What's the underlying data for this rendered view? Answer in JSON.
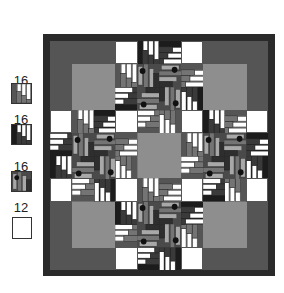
{
  "colors": {
    "border": "#2a2a2a",
    "dark": "#555555",
    "light_gray": "#8e8e8e",
    "medium": "#747474",
    "black": "#1c1c1c",
    "white": "#ffffff",
    "strip_light": "#a8a8a8"
  },
  "legend": [
    {
      "count": "16",
      "type": "steps-gray",
      "icon": "log-cabin-gray-block-icon"
    },
    {
      "count": "16",
      "type": "steps-black",
      "icon": "log-cabin-black-block-icon"
    },
    {
      "count": "16",
      "type": "dot",
      "icon": "dot-block-icon"
    },
    {
      "count": "12",
      "type": "white",
      "icon": "white-square-icon"
    }
  ],
  "quilt": {
    "units": 10,
    "corners": [
      {
        "r": 0,
        "c": 0,
        "light_r": 1,
        "light_c": 1
      },
      {
        "r": 0,
        "c": 7,
        "light_r": 1,
        "light_c": 7
      },
      {
        "r": 7,
        "c": 0,
        "light_r": 7,
        "light_c": 1
      },
      {
        "r": 7,
        "c": 7,
        "light_r": 7,
        "light_c": 7
      }
    ],
    "center": {
      "r": 4,
      "c": 4,
      "size": 2
    },
    "whites": [
      [
        0,
        3
      ],
      [
        0,
        6
      ],
      [
        3,
        0
      ],
      [
        3,
        3
      ],
      [
        3,
        6
      ],
      [
        3,
        9
      ],
      [
        6,
        0
      ],
      [
        6,
        3
      ],
      [
        6,
        6
      ],
      [
        6,
        9
      ],
      [
        9,
        3
      ],
      [
        9,
        6
      ]
    ],
    "pieced": [
      {
        "r": 0,
        "c": 4,
        "t": "B",
        "rot": 0
      },
      {
        "r": 0,
        "c": 5,
        "t": "B",
        "rot": 90
      },
      {
        "r": 1,
        "c": 3,
        "t": "A",
        "rot": 0
      },
      {
        "r": 2,
        "c": 3,
        "t": "B",
        "rot": 270
      },
      {
        "r": 1,
        "c": 6,
        "t": "A",
        "rot": 90
      },
      {
        "r": 2,
        "c": 6,
        "t": "B",
        "rot": 180
      },
      {
        "r": 1,
        "c": 4,
        "t": "C",
        "rot": 0
      },
      {
        "r": 1,
        "c": 5,
        "t": "C",
        "rot": 90
      },
      {
        "r": 2,
        "c": 4,
        "t": "C",
        "rot": 270
      },
      {
        "r": 2,
        "c": 5,
        "t": "C",
        "rot": 180
      },
      {
        "r": 3,
        "c": 4,
        "t": "A",
        "rot": 270
      },
      {
        "r": 3,
        "c": 5,
        "t": "A",
        "rot": 180
      },
      {
        "r": 9,
        "c": 4,
        "t": "B",
        "rot": 270
      },
      {
        "r": 9,
        "c": 5,
        "t": "B",
        "rot": 180
      },
      {
        "r": 8,
        "c": 3,
        "t": "A",
        "rot": 270
      },
      {
        "r": 7,
        "c": 3,
        "t": "B",
        "rot": 0
      },
      {
        "r": 8,
        "c": 6,
        "t": "A",
        "rot": 180
      },
      {
        "r": 7,
        "c": 6,
        "t": "B",
        "rot": 90
      },
      {
        "r": 7,
        "c": 4,
        "t": "C",
        "rot": 0
      },
      {
        "r": 7,
        "c": 5,
        "t": "C",
        "rot": 90
      },
      {
        "r": 8,
        "c": 4,
        "t": "C",
        "rot": 270
      },
      {
        "r": 8,
        "c": 5,
        "t": "C",
        "rot": 180
      },
      {
        "r": 6,
        "c": 4,
        "t": "A",
        "rot": 0
      },
      {
        "r": 6,
        "c": 5,
        "t": "A",
        "rot": 90
      },
      {
        "r": 4,
        "c": 0,
        "t": "B",
        "rot": 270
      },
      {
        "r": 5,
        "c": 0,
        "t": "B",
        "rot": 0
      },
      {
        "r": 3,
        "c": 1,
        "t": "A",
        "rot": 0
      },
      {
        "r": 3,
        "c": 2,
        "t": "B",
        "rot": 90
      },
      {
        "r": 6,
        "c": 1,
        "t": "A",
        "rot": 270
      },
      {
        "r": 6,
        "c": 2,
        "t": "B",
        "rot": 180
      },
      {
        "r": 4,
        "c": 1,
        "t": "C",
        "rot": 0
      },
      {
        "r": 4,
        "c": 2,
        "t": "C",
        "rot": 90
      },
      {
        "r": 5,
        "c": 1,
        "t": "C",
        "rot": 270
      },
      {
        "r": 5,
        "c": 2,
        "t": "C",
        "rot": 180
      },
      {
        "r": 4,
        "c": 3,
        "t": "A",
        "rot": 90
      },
      {
        "r": 5,
        "c": 3,
        "t": "A",
        "rot": 180
      },
      {
        "r": 4,
        "c": 9,
        "t": "B",
        "rot": 90
      },
      {
        "r": 5,
        "c": 9,
        "t": "B",
        "rot": 180
      },
      {
        "r": 3,
        "c": 8,
        "t": "A",
        "rot": 90
      },
      {
        "r": 3,
        "c": 7,
        "t": "B",
        "rot": 0
      },
      {
        "r": 6,
        "c": 8,
        "t": "A",
        "rot": 180
      },
      {
        "r": 6,
        "c": 7,
        "t": "B",
        "rot": 270
      },
      {
        "r": 4,
        "c": 7,
        "t": "C",
        "rot": 0
      },
      {
        "r": 4,
        "c": 8,
        "t": "C",
        "rot": 90
      },
      {
        "r": 5,
        "c": 7,
        "t": "C",
        "rot": 270
      },
      {
        "r": 5,
        "c": 8,
        "t": "C",
        "rot": 180
      },
      {
        "r": 4,
        "c": 6,
        "t": "A",
        "rot": 0
      },
      {
        "r": 5,
        "c": 6,
        "t": "A",
        "rot": 270
      },
      {
        "r": 3,
        "c": 3,
        "t": "W",
        "rot": 0
      }
    ]
  }
}
